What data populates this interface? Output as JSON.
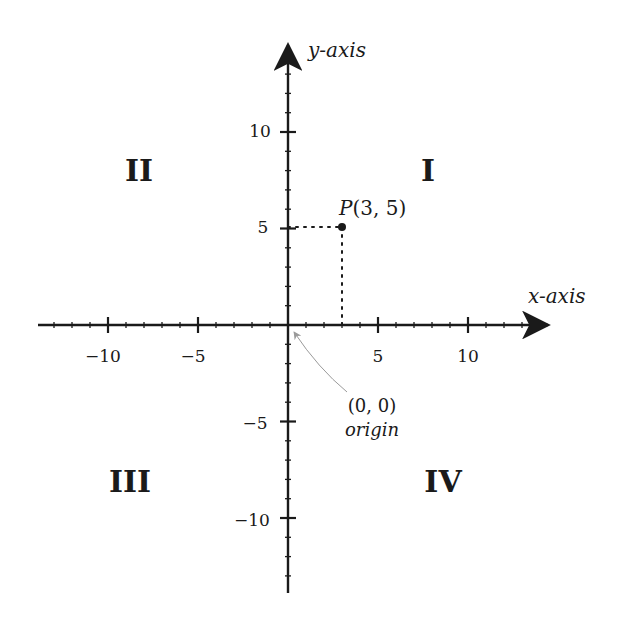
{
  "diagram": {
    "type": "cartesian-coordinate-plane",
    "axes": {
      "x_label": "x-axis",
      "y_label": "y-axis",
      "x_range": [
        -14,
        14
      ],
      "y_range": [
        -14,
        14
      ],
      "major_ticks": [
        -10,
        -5,
        5,
        10
      ],
      "minor_tick_step": 1
    },
    "x_tick_labels": [
      "−10",
      "−5",
      "5",
      "10"
    ],
    "y_tick_labels": [
      "10",
      "5",
      "−5",
      "−10"
    ],
    "quadrants": [
      {
        "id": "I",
        "label": "I"
      },
      {
        "id": "II",
        "label": "II"
      },
      {
        "id": "III",
        "label": "III"
      },
      {
        "id": "IV",
        "label": "IV"
      }
    ],
    "point": {
      "name": "P",
      "x": 3,
      "y": 5,
      "label_name": "P",
      "label_coords": "(3, 5)"
    },
    "origin": {
      "coords_label": "(0, 0)",
      "name_label": "origin"
    },
    "colors": {
      "axis": "#1a1a1a",
      "annotation_arrow": "#a0a0a0",
      "background": "#ffffff"
    }
  }
}
